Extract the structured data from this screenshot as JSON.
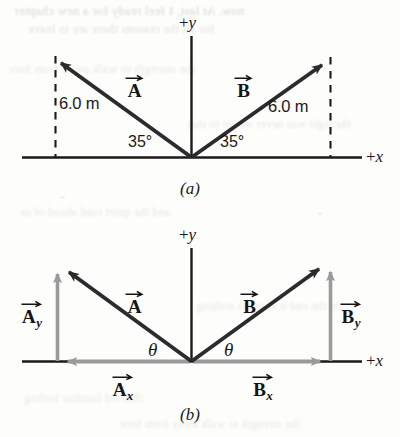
{
  "figure": {
    "colors": {
      "ink": "#1a1a1a",
      "vector_dark": "#2b2b2b",
      "component_gray": "#9a9a9a",
      "paper": "#fdfdfb",
      "bleed_text": "#c9c6c0"
    },
    "panels": [
      {
        "id": "a",
        "caption": "(a)",
        "axis_y_label": "+y",
        "axis_x_label": "+x",
        "vectors": [
          {
            "name": "A",
            "label": "A",
            "angle_label": "35°",
            "magnitude_label": "6.0 m",
            "direction": "up-left"
          },
          {
            "name": "B",
            "label": "B",
            "angle_label": "35°",
            "magnitude_label": "6.0 m",
            "direction": "up-right"
          }
        ]
      },
      {
        "id": "b",
        "caption": "(b)",
        "axis_y_label": "+y",
        "axis_x_label": "+x",
        "vectors": [
          {
            "name": "A",
            "label": "A",
            "angle_label": "θ",
            "direction": "up-left"
          },
          {
            "name": "B",
            "label": "B",
            "angle_label": "θ",
            "direction": "up-right"
          }
        ],
        "components": [
          {
            "name": "Ay",
            "letter": "A",
            "subscript": "y",
            "axis": "y",
            "direction": "up"
          },
          {
            "name": "Ax",
            "letter": "A",
            "subscript": "x",
            "axis": "x",
            "direction": "left"
          },
          {
            "name": "By",
            "letter": "B",
            "subscript": "y",
            "axis": "y",
            "direction": "up"
          },
          {
            "name": "Bx",
            "letter": "B",
            "subscript": "x",
            "axis": "x",
            "direction": "right"
          }
        ]
      }
    ]
  },
  "bleed_text": [
    "now. At last, I feel ready for a new chapter",
    "for all the reasons there are to leave",
    "the strength to walk away from here",
    "the light was never meant to stay",
    "and the quiet road ahead of us",
    "in the end it came to nothing",
    "that old familiar feeling"
  ]
}
